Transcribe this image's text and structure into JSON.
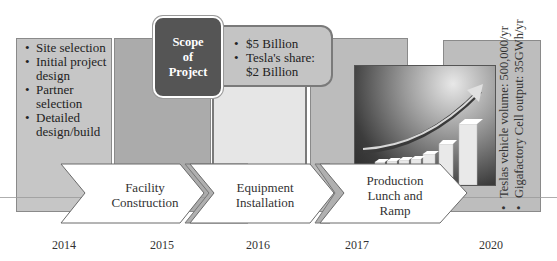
{
  "timeline": {
    "years": [
      "2014",
      "2015",
      "2016",
      "2017",
      "2020"
    ],
    "column_colors": [
      "#c6c6c6",
      "#ababab",
      "#e6e6e6",
      "#bcbcbc",
      "#bdbdbd"
    ]
  },
  "phase_2014": {
    "bullets": [
      "Site selection",
      "Initial project design",
      "Partner selection",
      "Detailed design/build"
    ]
  },
  "scope_box": {
    "line1": "Scope",
    "line2": "of",
    "line3": "Project",
    "color": "#555555"
  },
  "cost_box": {
    "bullets": [
      "$5 Billion",
      "Tesla's share: $2 Billion"
    ]
  },
  "arrows": [
    {
      "line1": "Facility",
      "line2": "Construction"
    },
    {
      "line1": "Equipment",
      "line2": "Installation"
    },
    {
      "line1": "Production",
      "line2": "Lunch and",
      "line3": "Ramp"
    }
  ],
  "target_2020": {
    "bullets": [
      "Teslas vehicle volume: 500,000/yr",
      "Gigafactory Cell output: 35GWh/yr"
    ]
  },
  "image": {
    "icon": "rising-bar-chart-arrow-icon"
  }
}
